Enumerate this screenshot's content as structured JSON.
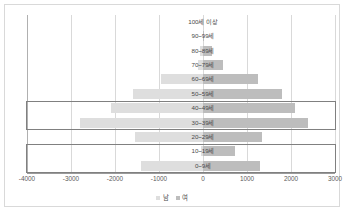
{
  "chart_data": {
    "type": "bar",
    "subtype": "population-pyramid",
    "title": "",
    "xlabel": "",
    "ylabel": "",
    "orientation": "horizontal",
    "grid": true,
    "legend_position": "bottom",
    "xlim": [
      -4000,
      3000
    ],
    "xticks": [
      -4000,
      -3000,
      -2000,
      -1000,
      0,
      1000,
      2000,
      3000
    ],
    "xtick_labels": [
      "-4000",
      "-3000",
      "-2000",
      "-1000",
      "0",
      "1000",
      "2000",
      "3000"
    ],
    "categories": [
      "100세 이상",
      "90~99세",
      "80~89세",
      "70~79세",
      "60~69세",
      "50~59세",
      "40~49세",
      "30~39세",
      "20~29세",
      "10~19세",
      "0~9세"
    ],
    "series": [
      {
        "name": "남",
        "color": "#dedede",
        "values": [
          0,
          -10,
          -60,
          -110,
          -950,
          -1600,
          -2100,
          -2800,
          -1550,
          -50,
          -1400
        ]
      },
      {
        "name": "여",
        "color": "#bdbdbd",
        "values": [
          0,
          20,
          200,
          450,
          1250,
          1800,
          2080,
          2380,
          1330,
          730,
          1300
        ]
      }
    ],
    "annotations": [
      {
        "name": "highlight-30-49",
        "categories": [
          "40~49세",
          "30~39세"
        ]
      },
      {
        "name": "highlight-0-19",
        "categories": [
          "10~19세",
          "0~9세"
        ]
      }
    ]
  },
  "legend": {
    "items": [
      {
        "label": "남",
        "color": "#dedede"
      },
      {
        "label": "여",
        "color": "#bdbdbd"
      }
    ]
  },
  "colors": {
    "male_bar": "#dedede",
    "female_bar": "#bdbdbd",
    "gridline": "#d9d9d9",
    "axis": "#9a9a9a",
    "highlight_border": "#808080",
    "frame_border": "#d9d9d9",
    "text": "#4a4a4a",
    "background": "#ffffff"
  }
}
